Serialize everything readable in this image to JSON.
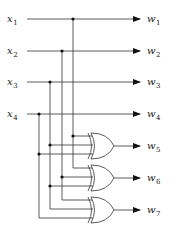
{
  "diagram": {
    "type": "xor-encoder-circuit",
    "inputs": [
      {
        "name": "x",
        "sub": "1"
      },
      {
        "name": "x",
        "sub": "2"
      },
      {
        "name": "x",
        "sub": "3"
      },
      {
        "name": "x",
        "sub": "4"
      }
    ],
    "outputs": [
      {
        "name": "w",
        "sub": "1"
      },
      {
        "name": "w",
        "sub": "2"
      },
      {
        "name": "w",
        "sub": "3"
      },
      {
        "name": "w",
        "sub": "4"
      },
      {
        "name": "w",
        "sub": "5"
      },
      {
        "name": "w",
        "sub": "6"
      },
      {
        "name": "w",
        "sub": "7"
      }
    ],
    "gates": [
      {
        "type": "XOR",
        "output": 5,
        "inputs": [
          1,
          3,
          4
        ]
      },
      {
        "type": "XOR",
        "output": 6,
        "inputs": [
          1,
          2,
          3
        ]
      },
      {
        "type": "XOR",
        "output": 7,
        "inputs": [
          2,
          3,
          4
        ]
      }
    ],
    "line_color": "#333333"
  }
}
